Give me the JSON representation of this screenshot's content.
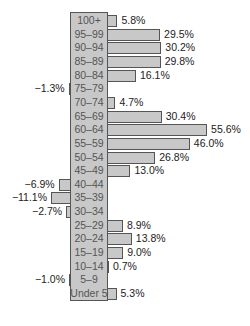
{
  "chart_data": {
    "type": "bar",
    "orientation": "horizontal",
    "title": "",
    "xlabel": "",
    "ylabel": "",
    "categories": [
      "100+",
      "95–99",
      "90–94",
      "85–89",
      "80–84",
      "75–79",
      "70–74",
      "65–69",
      "60–64",
      "55–59",
      "50–54",
      "45–49",
      "40–44",
      "35–39",
      "30–34",
      "25–29",
      "20–24",
      "15–19",
      "10–14",
      "5–9",
      "Under 5"
    ],
    "values": [
      5.8,
      29.5,
      30.2,
      29.8,
      16.1,
      -1.3,
      4.7,
      30.4,
      55.6,
      46.0,
      26.8,
      13.0,
      -6.9,
      -11.1,
      -2.7,
      8.9,
      13.8,
      9.0,
      0.7,
      -1.0,
      5.3
    ],
    "labels": [
      "5.8%",
      "29.5%",
      "30.2%",
      "29.8%",
      "16.1%",
      "−1.3%",
      "4.7%",
      "30.4%",
      "55.6%",
      "46.0%",
      "26.8%",
      "13.0%",
      "−6.9%",
      "−11.1%",
      "−2.7%",
      "8.9%",
      "13.8%",
      "9.0%",
      "0.7%",
      "−1.0%",
      "5.3%"
    ],
    "unit": "%",
    "grid": false,
    "legend": null
  },
  "colors": {
    "bar_fill": "#c8c8c8",
    "bar_border": "#555555",
    "label_text": "#555555",
    "value_text": "#222222"
  }
}
